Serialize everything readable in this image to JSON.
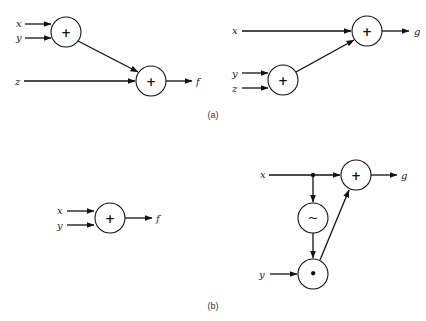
{
  "figure": {
    "parts": [
      {
        "caption": "(a)",
        "diagrams": [
          {
            "name": "f-diagram",
            "inputs": [
              "x",
              "y",
              "z"
            ],
            "nodes": [
              {
                "id": "n1",
                "op": "+",
                "inputs": [
                  "x",
                  "y"
                ]
              },
              {
                "id": "n2",
                "op": "+",
                "inputs": [
                  "n1",
                  "z"
                ]
              }
            ],
            "output": "f"
          },
          {
            "name": "g-diagram",
            "inputs": [
              "x",
              "y",
              "z"
            ],
            "nodes": [
              {
                "id": "n3",
                "op": "+",
                "inputs": [
                  "y",
                  "z"
                ]
              },
              {
                "id": "n4",
                "op": "+",
                "inputs": [
                  "x",
                  "n3"
                ]
              }
            ],
            "output": "g"
          }
        ]
      },
      {
        "caption": "(b)",
        "diagrams": [
          {
            "name": "f-diagram",
            "inputs": [
              "x",
              "y"
            ],
            "nodes": [
              {
                "id": "n5",
                "op": "+",
                "inputs": [
                  "x",
                  "y"
                ]
              }
            ],
            "output": "f"
          },
          {
            "name": "g-diagram",
            "inputs": [
              "x",
              "y"
            ],
            "nodes": [
              {
                "id": "n6",
                "op": "~",
                "inputs": [
                  "x"
                ]
              },
              {
                "id": "n7",
                "op": "•",
                "inputs": [
                  "n6",
                  "y"
                ]
              },
              {
                "id": "n8",
                "op": "+",
                "inputs": [
                  "x",
                  "n7"
                ]
              }
            ],
            "output": "g"
          }
        ]
      }
    ]
  },
  "labels": {
    "a": {
      "x": "x",
      "y": "y",
      "z": "z",
      "f": "f",
      "x2": "x",
      "y2": "y",
      "z2": "z",
      "g": "g"
    },
    "b": {
      "x": "x",
      "y": "y",
      "f": "f",
      "x2": "x",
      "y2": "y",
      "g": "g"
    },
    "ops": {
      "plus": "+",
      "tilde": "~",
      "dot": "•"
    },
    "captions": {
      "a": "(a)",
      "b": "(b)"
    }
  }
}
